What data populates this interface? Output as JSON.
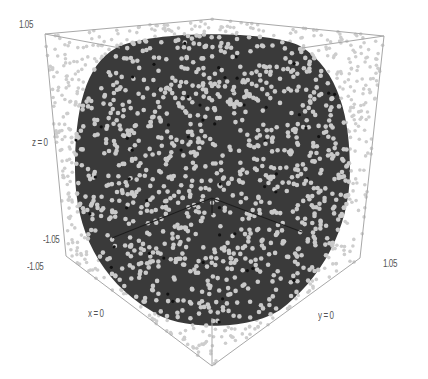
{
  "chart_data": {
    "type": "scatter3d",
    "title": "",
    "axes": {
      "x": {
        "label": "x = 0",
        "range": [
          -1.05,
          1.05
        ]
      },
      "y": {
        "label": "y = 0",
        "range": [
          -1.05,
          1.05
        ]
      },
      "z": {
        "label": "z = 0",
        "range": [
          -1.05,
          1.05
        ]
      }
    },
    "tick_labels": {
      "z_top": "1.05",
      "z_bottom": "-1.05",
      "x_min": "-1.05",
      "y_max": "1.05"
    },
    "colors": {
      "background": "#ffffff",
      "solid": "#3a3a3a",
      "inner_points": "#c9c9c9",
      "outer_points": "#cdcdcd",
      "box_edges": "#a8a8a8",
      "solid_edges": "#1e1e1e"
    },
    "box": {
      "top_left": [
        45,
        34
      ],
      "top_back": [
        213,
        19
      ],
      "top_right": [
        384,
        36
      ],
      "top_front": [
        214,
        52
      ],
      "bottom_left": [
        66,
        256
      ],
      "bottom_front": [
        212,
        366
      ],
      "bottom_right": [
        360,
        258
      ]
    },
    "grid": false,
    "legend": null
  },
  "labels": {
    "z_top": "1.05",
    "z_mid": "z = 0",
    "z_bottom": "-1.05",
    "x_min": "-1.05",
    "x_axis": "x = 0",
    "y_axis": "y = 0",
    "y_max": "1.05"
  }
}
